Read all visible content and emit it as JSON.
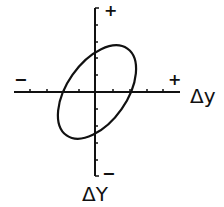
{
  "diagram": {
    "type": "hysteresis-loop",
    "x_axis": {
      "label": "Δy",
      "positive_sign": "+",
      "negative_sign": "−",
      "tick_count_each_side": 4
    },
    "y_axis": {
      "label": "ΔY",
      "positive_sign": "+",
      "negative_sign": "−",
      "tick_count_each_side": 5
    },
    "curve": {
      "shape": "tilted ellipse",
      "stroke_color": "#111111"
    }
  }
}
